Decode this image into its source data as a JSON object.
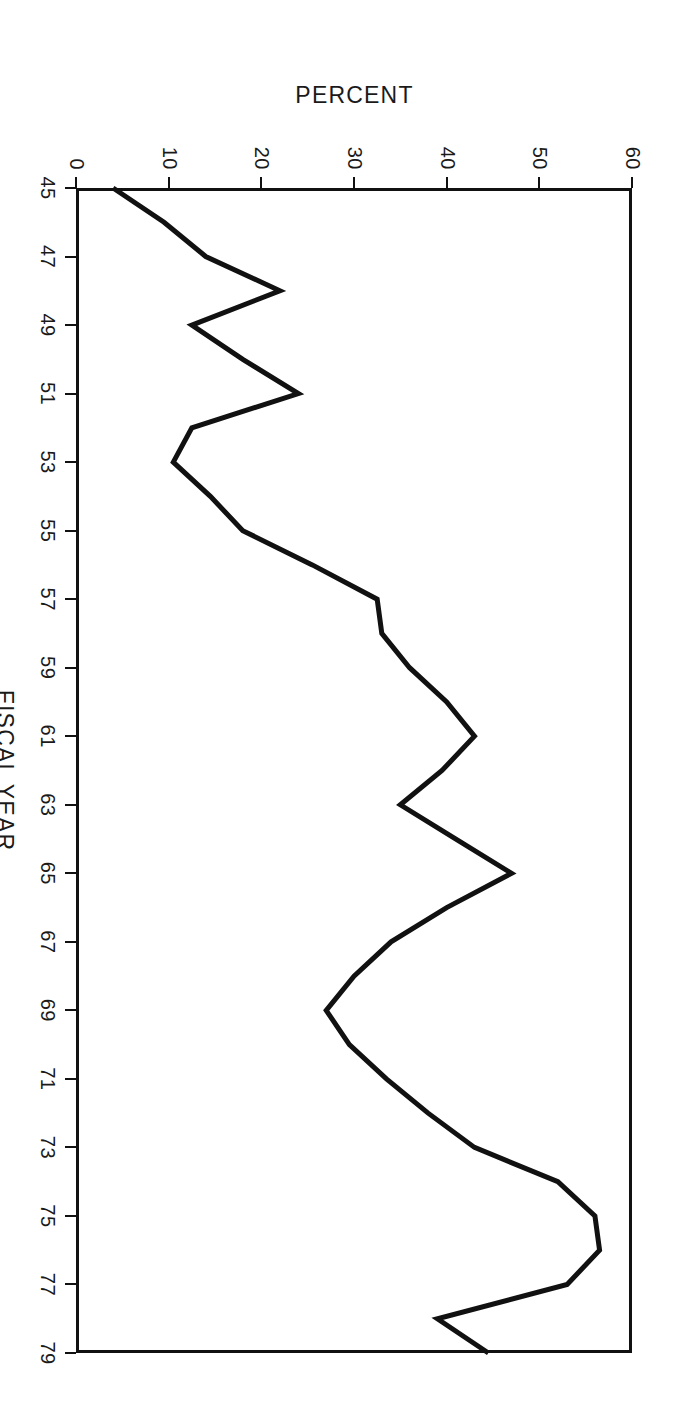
{
  "chart_data": {
    "type": "line",
    "title": "",
    "xlabel": "FISCAL YEAR",
    "ylabel": "PERCENT",
    "xlim": [
      45,
      79
    ],
    "ylim": [
      0,
      60
    ],
    "xticks": [
      45,
      47,
      49,
      51,
      53,
      55,
      57,
      59,
      61,
      63,
      65,
      67,
      69,
      71,
      73,
      75,
      77,
      79
    ],
    "yticks": [
      0,
      10,
      20,
      30,
      40,
      50,
      60
    ],
    "grid": false,
    "legend": false,
    "orientation": "rotated-90-clockwise",
    "line_color": "#111111",
    "x": [
      45,
      46,
      47,
      48,
      49,
      50,
      51,
      52,
      53,
      54,
      55,
      56,
      57,
      58,
      59,
      60,
      61,
      62,
      63,
      64,
      65,
      66,
      67,
      68,
      69,
      70,
      71,
      72,
      73,
      74,
      75,
      76,
      77,
      78,
      79
    ],
    "values": [
      4,
      9.5,
      14,
      22,
      12.5,
      18,
      24,
      12.5,
      10.5,
      14.5,
      18,
      25.5,
      32.5,
      33,
      36,
      40,
      43,
      39.5,
      35,
      41,
      47,
      40,
      34,
      30,
      27,
      29.5,
      33.5,
      38,
      43,
      52,
      56,
      56.5,
      53,
      39,
      44.5
    ],
    "series": [
      {
        "name": "percent",
        "values": [
          4,
          9.5,
          14,
          22,
          12.5,
          18,
          24,
          12.5,
          10.5,
          14.5,
          18,
          25.5,
          32.5,
          33,
          36,
          40,
          43,
          39.5,
          35,
          41,
          47,
          40,
          34,
          30,
          27,
          29.5,
          33.5,
          38,
          43,
          52,
          56,
          56.5,
          53,
          39,
          44.5
        ]
      }
    ]
  },
  "axes": {
    "x_title": "FISCAL YEAR",
    "y_title": "PERCENT",
    "x_tick_labels": [
      "45",
      "47",
      "49",
      "51",
      "53",
      "55",
      "57",
      "59",
      "61",
      "63",
      "65",
      "67",
      "69",
      "71",
      "73",
      "75",
      "77",
      "79"
    ],
    "y_tick_labels": [
      "0",
      "10",
      "20",
      "30",
      "40",
      "50",
      "60"
    ]
  }
}
